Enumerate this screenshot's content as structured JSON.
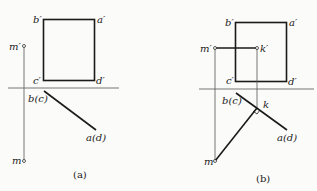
{
  "panels": [
    {
      "id": "a",
      "caption": "(a)",
      "labels": {
        "b_prime": "b′",
        "a_prime": "a′",
        "c_prime": "c′",
        "d_prime": "d′",
        "m_prime": "m′",
        "bc": "b(c)",
        "ad": "a(d)",
        "m": "m"
      }
    },
    {
      "id": "b",
      "caption": "(b)",
      "labels": {
        "b_prime": "b′",
        "a_prime": "a′",
        "c_prime": "c′",
        "d_prime": "d′",
        "m_prime": "m′",
        "k_prime": "k′",
        "bc": "b(c)",
        "ad": "a(d)",
        "k": "k",
        "m": "m"
      }
    }
  ],
  "colors": {
    "stroke": "#1a1a1a",
    "thin": "#555555",
    "background": "#fbfbf9"
  }
}
